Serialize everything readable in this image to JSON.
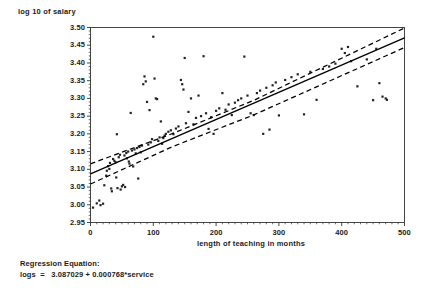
{
  "chart_data": {
    "type": "scatter",
    "title": "",
    "xlabel": "length of teaching in months",
    "ylabel": "log 10 of salary",
    "xlim": [
      0,
      500
    ],
    "ylim": [
      2.95,
      3.5
    ],
    "grid": false,
    "legend": null,
    "xticks": [
      "0",
      "100",
      "200",
      "300",
      "400",
      "500"
    ],
    "xtick_values": [
      0,
      100,
      200,
      300,
      400,
      500
    ],
    "yticks": [
      "3.50",
      "3.45",
      "3.40",
      "3.35",
      "3.30",
      "3.25",
      "3.20",
      "3.15",
      "3.10",
      "3.05",
      "3.00",
      "2.95"
    ],
    "ytick_values": [
      3.5,
      3.45,
      3.4,
      3.35,
      3.3,
      3.25,
      3.2,
      3.15,
      3.1,
      3.05,
      3.0,
      2.95
    ],
    "series": [
      {
        "name": "observations",
        "type": "scatter",
        "marker": "dot",
        "color": "#222222",
        "points": [
          [
            4,
            2.992
          ],
          [
            10,
            3.004
          ],
          [
            14,
            3.012
          ],
          [
            16,
            2.999
          ],
          [
            20,
            3.003
          ],
          [
            22,
            3.055
          ],
          [
            25,
            3.082
          ],
          [
            26,
            3.096
          ],
          [
            28,
            3.109
          ],
          [
            30,
            3.101
          ],
          [
            31,
            3.118
          ],
          [
            33,
            3.046
          ],
          [
            34,
            3.038
          ],
          [
            36,
            3.129
          ],
          [
            38,
            3.124
          ],
          [
            40,
            3.12
          ],
          [
            41,
            3.077
          ],
          [
            42,
            3.199
          ],
          [
            43,
            3.047
          ],
          [
            45,
            3.134
          ],
          [
            47,
            3.141
          ],
          [
            48,
            3.043
          ],
          [
            50,
            3.052
          ],
          [
            52,
            3.056
          ],
          [
            54,
            3.139
          ],
          [
            55,
            3.05
          ],
          [
            57,
            3.146
          ],
          [
            58,
            3.131
          ],
          [
            60,
            3.15
          ],
          [
            61,
            3.122
          ],
          [
            62,
            3.116
          ],
          [
            64,
            3.259
          ],
          [
            66,
            3.153
          ],
          [
            68,
            3.108
          ],
          [
            70,
            3.156
          ],
          [
            72,
            3.145
          ],
          [
            74,
            3.16
          ],
          [
            76,
            3.074
          ],
          [
            78,
            3.163
          ],
          [
            80,
            3.148
          ],
          [
            82,
            3.167
          ],
          [
            84,
            3.34
          ],
          [
            86,
            3.362
          ],
          [
            88,
            3.348
          ],
          [
            90,
            3.29
          ],
          [
            92,
            3.17
          ],
          [
            94,
            3.267
          ],
          [
            96,
            3.176
          ],
          [
            98,
            3.185
          ],
          [
            100,
            3.474
          ],
          [
            102,
            3.356
          ],
          [
            104,
            3.3
          ],
          [
            106,
            3.298
          ],
          [
            108,
            3.18
          ],
          [
            110,
            3.19
          ],
          [
            112,
            3.235
          ],
          [
            114,
            3.172
          ],
          [
            116,
            3.188
          ],
          [
            118,
            3.195
          ],
          [
            120,
            3.2
          ],
          [
            124,
            3.206
          ],
          [
            128,
            3.21
          ],
          [
            132,
            3.199
          ],
          [
            136,
            3.215
          ],
          [
            140,
            3.221
          ],
          [
            144,
            3.352
          ],
          [
            146,
            3.34
          ],
          [
            148,
            3.325
          ],
          [
            150,
            3.414
          ],
          [
            152,
            3.23
          ],
          [
            156,
            3.262
          ],
          [
            160,
            3.3
          ],
          [
            164,
            3.227
          ],
          [
            168,
            3.245
          ],
          [
            172,
            3.308
          ],
          [
            176,
            3.25
          ],
          [
            180,
            3.419
          ],
          [
            184,
            3.258
          ],
          [
            188,
            3.214
          ],
          [
            192,
            3.247
          ],
          [
            196,
            3.2
          ],
          [
            200,
            3.265
          ],
          [
            205,
            3.272
          ],
          [
            210,
            3.315
          ],
          [
            215,
            3.268
          ],
          [
            220,
            3.283
          ],
          [
            225,
            3.253
          ],
          [
            230,
            3.288
          ],
          [
            235,
            3.295
          ],
          [
            240,
            3.3
          ],
          [
            245,
            3.418
          ],
          [
            250,
            3.308
          ],
          [
            255,
            3.258
          ],
          [
            260,
            3.253
          ],
          [
            265,
            3.315
          ],
          [
            270,
            3.322
          ],
          [
            275,
            3.2
          ],
          [
            280,
            3.33
          ],
          [
            285,
            3.212
          ],
          [
            290,
            3.337
          ],
          [
            295,
            3.345
          ],
          [
            300,
            3.252
          ],
          [
            310,
            3.352
          ],
          [
            320,
            3.36
          ],
          [
            330,
            3.368
          ],
          [
            340,
            3.255
          ],
          [
            350,
            3.375
          ],
          [
            360,
            3.296
          ],
          [
            370,
            3.383
          ],
          [
            380,
            3.39
          ],
          [
            390,
            3.398
          ],
          [
            400,
            3.44
          ],
          [
            405,
            3.428
          ],
          [
            410,
            3.445
          ],
          [
            415,
            3.405
          ],
          [
            425,
            3.334
          ],
          [
            440,
            3.41
          ],
          [
            450,
            3.295
          ],
          [
            455,
            3.44
          ],
          [
            460,
            3.343
          ],
          [
            465,
            3.305
          ],
          [
            470,
            3.3
          ],
          [
            472,
            3.296
          ]
        ]
      },
      {
        "name": "fitted regression line",
        "type": "line",
        "style": "solid",
        "color": "#000000",
        "x": [
          0,
          500
        ],
        "y": [
          3.087029,
          3.471029
        ]
      },
      {
        "name": "confidence band upper",
        "type": "line",
        "style": "dashed",
        "color": "#000000",
        "x": [
          0,
          130,
          260,
          500
        ],
        "y": [
          3.1155,
          3.2005,
          3.2945,
          3.4985
        ]
      },
      {
        "name": "confidence band lower",
        "type": "line",
        "style": "dashed",
        "color": "#000000",
        "x": [
          0,
          130,
          260,
          500
        ],
        "y": [
          3.0585,
          3.1635,
          3.2535,
          3.4435
        ]
      }
    ],
    "annotations": {
      "regression_equation_heading": "Regression Equation:",
      "regression_equation": "logs  =   3.087029 + 0.000768*service",
      "intercept": 3.087029,
      "slope": 0.000768,
      "response_variable": "logs",
      "predictor_variable": "service"
    }
  },
  "axes": {
    "y_title": "log 10 of salary",
    "x_title": "length of teaching in months"
  },
  "equation": {
    "heading": "Regression Equation:",
    "body": "logs  =   3.087029 + 0.000768*service"
  },
  "colors": {
    "axis": "#333333",
    "marker": "#222222",
    "line": "#000000",
    "background": "#ffffff"
  }
}
